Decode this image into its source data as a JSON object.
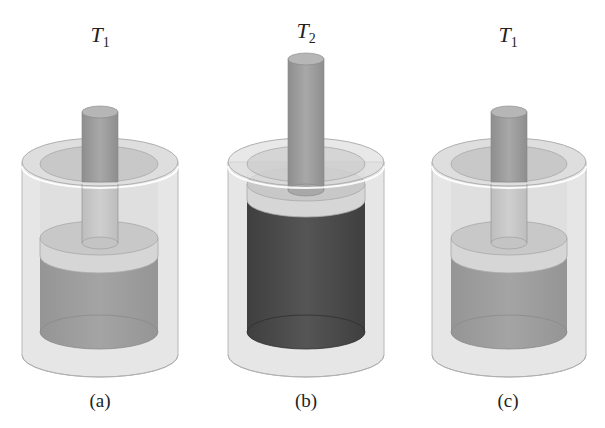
{
  "figure": {
    "panels": [
      {
        "id": "a",
        "label": "(a)",
        "temperature": {
          "symbol": "T",
          "subscript": "1"
        },
        "gas_state": "expanded",
        "gas_shade": "medium",
        "center_x": 100
      },
      {
        "id": "b",
        "label": "(b)",
        "temperature": {
          "symbol": "T",
          "subscript": "2"
        },
        "gas_state": "more expanded",
        "gas_shade": "dark",
        "center_x": 306
      },
      {
        "id": "c",
        "label": "(c)",
        "temperature": {
          "symbol": "T",
          "subscript": "1"
        },
        "gas_state": "expanded",
        "gas_shade": "medium",
        "center_x": 508
      }
    ],
    "colors": {
      "jacket": "#e4e4e4",
      "jacket_edge": "#b8b8b8",
      "inner_top": "#c8c8c8",
      "rod": "#9c9c9c",
      "piston": "#c9c9c9",
      "piston_side": "#d8d8d8",
      "gas_medium": "#9e9e9e",
      "gas_dark": "#4a4a4a"
    }
  }
}
